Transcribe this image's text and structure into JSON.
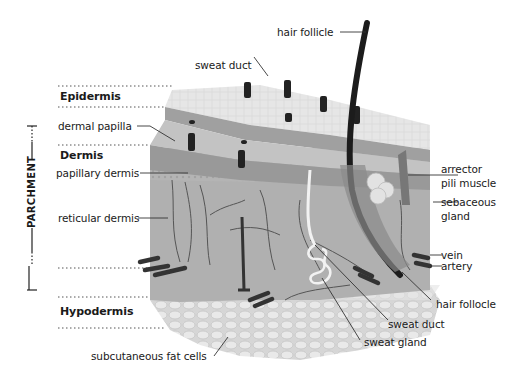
{
  "diagram": {
    "side_bracket_label": "PARCHMENT",
    "layers": [
      {
        "name": "Epidermis",
        "bold": true
      },
      {
        "name": "Dermis",
        "bold": true
      },
      {
        "name": "Hypodermis",
        "bold": true
      }
    ],
    "labels_left": [
      {
        "id": "dermal-papilla",
        "text": "dermal papilla"
      },
      {
        "id": "papillary-dermis",
        "text": "papillary dermis"
      },
      {
        "id": "reticular-dermis",
        "text": "reticular dermis"
      },
      {
        "id": "subcutaneous-fat-cells",
        "text": "subcutaneous fat cells"
      }
    ],
    "labels_top": [
      {
        "id": "sweat-duct-top",
        "text": "sweat duct"
      },
      {
        "id": "hair-follicle-top",
        "text": "hair follicle"
      }
    ],
    "labels_right": [
      {
        "id": "arrector-pili-line1",
        "text": "arrector"
      },
      {
        "id": "arrector-pili-line2",
        "text": "pili muscle"
      },
      {
        "id": "sebaceous-line1",
        "text": "sebaceous"
      },
      {
        "id": "sebaceous-line2",
        "text": "gland"
      },
      {
        "id": "vein",
        "text": "vein"
      },
      {
        "id": "artery",
        "text": "artery"
      },
      {
        "id": "hair-follicle-bottom",
        "text": "hair follocle"
      },
      {
        "id": "sweat-duct-bottom",
        "text": "sweat duct"
      },
      {
        "id": "sweat-gland",
        "text": "sweat gland"
      }
    ],
    "colors": {
      "epidermis_top": "#e4e4e4",
      "epidermis_dark": "#9a9a9a",
      "dermis_papillary": "#bdbdbd",
      "dermis_reticular": "#a8a8a8",
      "hypodermis": "#d8d8d8",
      "hair": "#1e1e1e",
      "text": "#1a1a1a"
    }
  }
}
